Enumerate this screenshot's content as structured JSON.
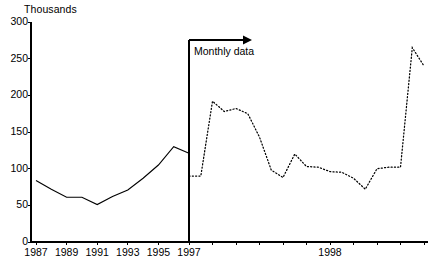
{
  "chart_data": {
    "type": "line",
    "title": "",
    "subtitle": "",
    "xlabel": "",
    "ylabel": "Thousands",
    "ylim": [
      0,
      300
    ],
    "yticks": [
      0,
      50,
      100,
      150,
      200,
      250,
      300
    ],
    "grid": false,
    "legend_position": "none",
    "annotations": [
      {
        "name": "monthly-data-annotation",
        "text": "Monthly data",
        "arrow": "right",
        "at_x": 1997.0
      }
    ],
    "xticks_annual": [
      {
        "label": "1987",
        "value": 1987
      },
      {
        "label": "1989",
        "value": 1989
      },
      {
        "label": "1991",
        "value": 1991
      },
      {
        "label": "1993",
        "value": 1993
      },
      {
        "label": "1995",
        "value": 1995
      },
      {
        "label": "1997",
        "value": 1997
      }
    ],
    "xticks_monthly": [
      {
        "label": "1998",
        "value": 1998
      }
    ],
    "series": [
      {
        "name": "Annual data",
        "style": "solid",
        "color": "#000000",
        "x": [
          1987,
          1988,
          1989,
          1990,
          1991,
          1992,
          1993,
          1994,
          1995,
          1996,
          1997
        ],
        "values": [
          84,
          72,
          61,
          61,
          51,
          62,
          71,
          87,
          105,
          130,
          121
        ]
      },
      {
        "name": "Monthly data",
        "style": "dotted",
        "color": "#000000",
        "x": [
          "1997-01",
          "1997-02",
          "1997-03",
          "1997-04",
          "1997-05",
          "1997-06",
          "1997-07",
          "1997-08",
          "1997-09",
          "1997-10",
          "1997-11",
          "1997-12",
          "1998-01",
          "1998-02",
          "1998-03",
          "1998-04",
          "1998-05",
          "1998-06",
          "1998-07",
          "1998-08",
          "1998-09"
        ],
        "values": [
          90,
          90,
          192,
          178,
          182,
          175,
          143,
          98,
          88,
          120,
          103,
          102,
          96,
          95,
          87,
          72,
          100,
          102,
          102,
          265,
          240
        ]
      }
    ]
  }
}
